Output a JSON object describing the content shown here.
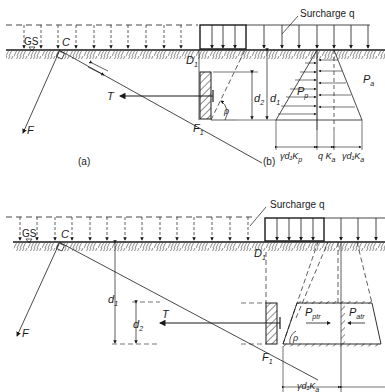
{
  "colors": {
    "ink": "#1a1a1a",
    "background": "#ffffff"
  },
  "figure_a": {
    "caption": "(a)",
    "surcharge_label": "Surcharge q",
    "ground_surface_label": "GS",
    "point_c": "C",
    "point_d1": "D",
    "point_d1_sub": "1",
    "point_f1": "F",
    "point_f1_sub": "1",
    "tie_force": "T",
    "force_f": "F",
    "angle": "ρ",
    "depth_d2": "d",
    "depth_d2_sub": "2",
    "depth_d1": "d",
    "depth_d1_sub": "1"
  },
  "figure_b": {
    "caption": "(b)",
    "passive_label": "P",
    "passive_sub": "p",
    "active_label": "P",
    "active_sub": "a",
    "dim_passive": "γd₁K",
    "dim_passive_sub": "p",
    "dim_q": "q K",
    "dim_q_sub": "a",
    "dim_active": "γd₁K",
    "dim_active_sub": "a"
  },
  "figure_c": {
    "surcharge_label": "Surcharge q",
    "ground_surface_label": "GS",
    "point_c": "C",
    "point_d1": "D",
    "point_d1_sub": "1",
    "point_f1": "F",
    "point_f1_sub": "1",
    "tie_force": "T",
    "force_f": "F",
    "angle": "ρ",
    "depth_d1": "d",
    "depth_d1_sub": "1",
    "depth_d2": "d",
    "depth_d2_sub": "2",
    "passive_tr": "P",
    "passive_tr_sub": "ptr",
    "active_tr": "P",
    "active_tr_sub": "atr",
    "dim_bottom": "γd₁K",
    "dim_bottom_sub": "a"
  }
}
